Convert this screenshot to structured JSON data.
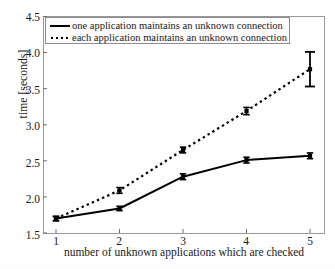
{
  "chart_data": {
    "type": "line",
    "title": "",
    "xlabel": "number of unknown applications which are checked",
    "ylabel": "time [seconds]",
    "x": [
      1,
      2,
      3,
      4,
      5
    ],
    "xlim": [
      0.6,
      5.3
    ],
    "ylim": [
      1.5,
      4.5
    ],
    "xticks": [
      "1",
      "2",
      "3",
      "4",
      "5"
    ],
    "yticks": [
      "1.5",
      "2.0",
      "2.5",
      "3.0",
      "3.5",
      "4.0",
      "4.5"
    ],
    "ytick_values": [
      1.5,
      2.0,
      2.5,
      3.0,
      3.5,
      4.0,
      4.5
    ],
    "grid": false,
    "legend_position": "upper-left",
    "series": [
      {
        "name": "one application maintains an unknown connection",
        "style": "solid",
        "marker": "square",
        "color": "#000000",
        "values": [
          1.7,
          1.84,
          2.28,
          2.51,
          2.57
        ],
        "errors": [
          0.03,
          0.03,
          0.04,
          0.04,
          0.04
        ]
      },
      {
        "name": "each application maintains an unknown connection",
        "style": "dotted",
        "marker": "square",
        "color": "#000000",
        "values": [
          1.7,
          2.09,
          2.65,
          3.19,
          3.77
        ],
        "errors": [
          0.03,
          0.04,
          0.04,
          0.05,
          0.24
        ]
      }
    ]
  },
  "legend": {
    "items": [
      {
        "label": "one application maintains an unknown connection",
        "style": "solid"
      },
      {
        "label": "each application maintains an unknown connection",
        "style": "dotted"
      }
    ]
  },
  "axes": {
    "y_label": "time [seconds]",
    "x_label": "number of unknown applications which are checked",
    "y_ticks": [
      "4.5",
      "4.0",
      "3.5",
      "3.0",
      "2.5",
      "2.0",
      "1.5"
    ],
    "x_ticks": [
      "1",
      "2",
      "3",
      "4",
      "5"
    ]
  }
}
